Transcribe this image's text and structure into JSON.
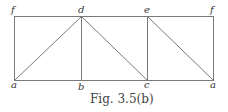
{
  "diagram": {
    "caption": "Fig. 3.5(b)",
    "vertices": {
      "f_left": {
        "label": "f",
        "x": 14,
        "y": 16
      },
      "d": {
        "label": "d",
        "x": 81,
        "y": 16
      },
      "e": {
        "label": "e",
        "x": 147,
        "y": 16
      },
      "f_right": {
        "label": "f",
        "x": 213,
        "y": 16
      },
      "a_left": {
        "label": "a",
        "x": 14,
        "y": 80
      },
      "b": {
        "label": "b",
        "x": 81,
        "y": 80
      },
      "c": {
        "label": "c",
        "x": 147,
        "y": 80
      },
      "a_right": {
        "label": "a",
        "x": 213,
        "y": 80
      }
    },
    "edges": [
      [
        "f_left",
        "f_right"
      ],
      [
        "a_left",
        "a_right"
      ],
      [
        "f_left",
        "a_left"
      ],
      [
        "f_right",
        "a_right"
      ],
      [
        "a_left",
        "d"
      ],
      [
        "d",
        "b"
      ],
      [
        "d",
        "c"
      ],
      [
        "e",
        "c"
      ],
      [
        "e",
        "a_right"
      ]
    ],
    "line_color": "#777777"
  }
}
